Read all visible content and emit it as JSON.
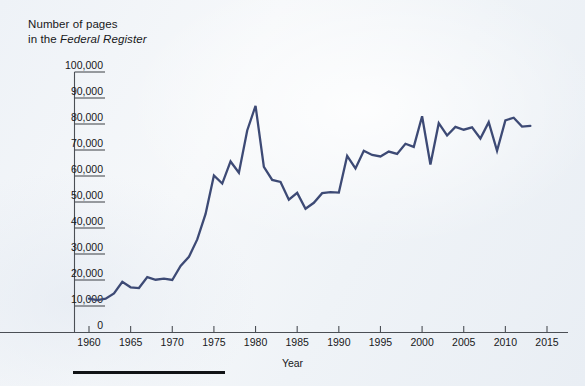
{
  "title": {
    "line1": "Number of pages",
    "line2_prefix": "in the ",
    "line2_italic": "Federal Register"
  },
  "axis": {
    "x_caption": "Year",
    "y_ticks": [
      "100,000",
      "90,000",
      "80,000",
      "70,000",
      "60,000",
      "50,000",
      "40,000",
      "30,000",
      "20,000",
      "10,000",
      "0"
    ],
    "x_ticks": [
      "1960",
      "1965",
      "1970",
      "1975",
      "1980",
      "1985",
      "1990",
      "1995",
      "2000",
      "2005",
      "2010",
      "2015"
    ]
  },
  "colors": {
    "line": "#3d4a75",
    "axis": "#4b4f55",
    "text": "#18181a",
    "background": "#f2f5f8",
    "footer_rule": "#111316"
  },
  "chart_data": {
    "type": "line",
    "title": "Number of pages in the Federal Register",
    "xlabel": "Year",
    "ylabel": "Number of pages in the Federal Register",
    "xlim": [
      1958,
      2016
    ],
    "ylim": [
      0,
      100000
    ],
    "ytick_interval": 10000,
    "xtick_interval": 5,
    "grid": false,
    "legend": null,
    "series_name": "Pages in the Federal Register",
    "x": [
      1960,
      1961,
      1962,
      1963,
      1964,
      1965,
      1966,
      1967,
      1968,
      1969,
      1970,
      1971,
      1972,
      1973,
      1974,
      1975,
      1976,
      1977,
      1978,
      1979,
      1980,
      1981,
      1982,
      1983,
      1984,
      1985,
      1986,
      1987,
      1988,
      1989,
      1990,
      1991,
      1992,
      1993,
      1994,
      1995,
      1996,
      1997,
      1998,
      1999,
      2000,
      2001,
      2002,
      2003,
      2004,
      2005,
      2006,
      2007,
      2008,
      2009,
      2010,
      2011,
      2012,
      2013
    ],
    "values": [
      12800,
      12300,
      12800,
      14800,
      19300,
      17200,
      16900,
      21100,
      20100,
      20500,
      20000,
      25400,
      28900,
      35600,
      45400,
      60200,
      57100,
      65600,
      61300,
      77500,
      87000,
      63500,
      58500,
      57700,
      50900,
      53500,
      47400,
      49700,
      53400,
      53800,
      53600,
      67700,
      62900,
      69700,
      68100,
      67500,
      69400,
      68500,
      72400,
      71200,
      83000,
      64400,
      80300,
      75600,
      78900,
      77800,
      78700,
      74400,
      80700,
      69700,
      81400,
      82400,
      79000,
      79300
    ]
  }
}
